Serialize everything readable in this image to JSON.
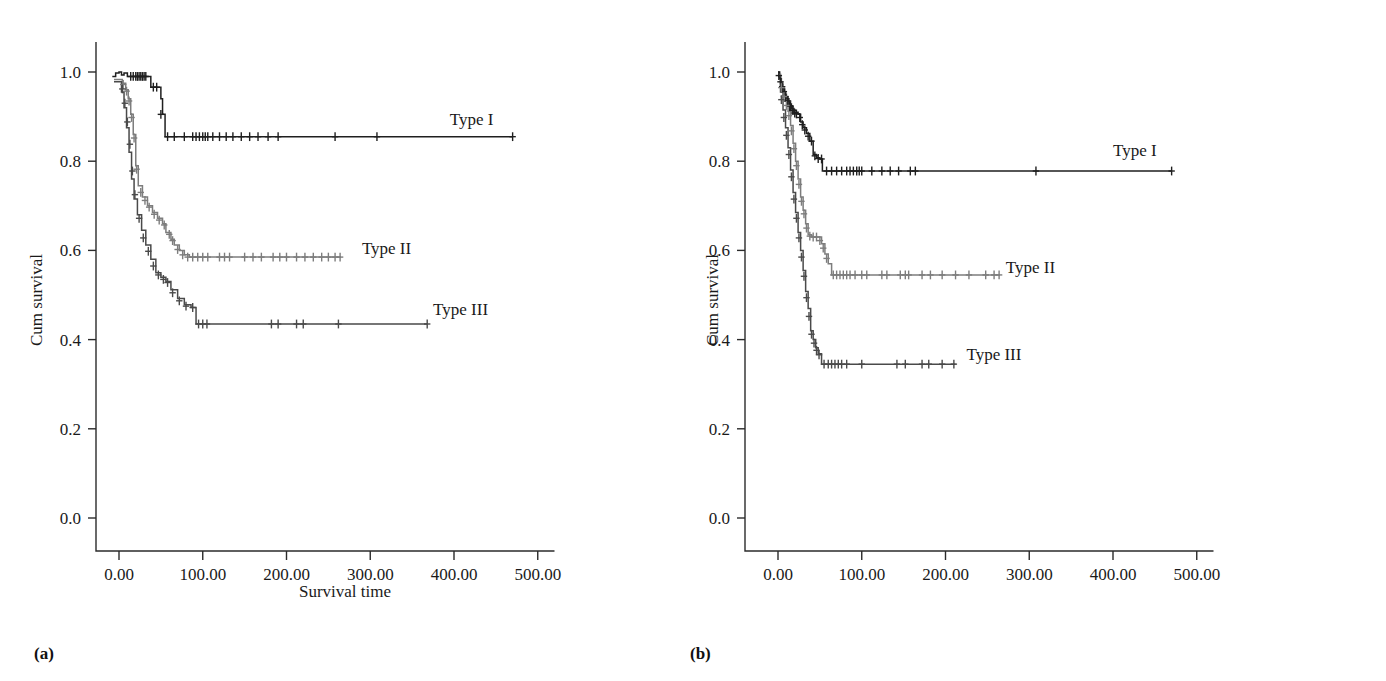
{
  "figure": {
    "panels": [
      {
        "id": "a",
        "caption": "(a)",
        "xlabel": "Survival time",
        "ylabel": "Cum survival"
      },
      {
        "id": "b",
        "caption": "(b)",
        "xlabel": "",
        "ylabel": "Cum survival"
      }
    ]
  },
  "labels": {
    "ylabel": "Cum survival",
    "xlabel_a": "Survival time",
    "caption_a": "(a)",
    "caption_b": "(b)",
    "type1": "Type I",
    "type2": "Type II",
    "type3": "Type III",
    "y_ticks": [
      "1.0",
      "0.8",
      "0.6",
      "0.4",
      "0.2",
      "0.0"
    ],
    "x_ticks": [
      "0.00",
      "100.00",
      "200.00",
      "300.00",
      "400.00",
      "500.00"
    ]
  },
  "colors": {
    "type1": "#1f1f1f",
    "type2": "#7d7d7d",
    "type3": "#4a4a4a",
    "axis": "#2b2b2b",
    "text": "#1a1a1a",
    "background": "#ffffff"
  },
  "chart_data": [
    {
      "type": "line",
      "subtype": "kaplan-meier",
      "panel": "a",
      "title": "",
      "xlabel": "Survival time",
      "ylabel": "Cum survival",
      "xlim": [
        -20,
        520
      ],
      "ylim": [
        0.0,
        1.02
      ],
      "x_ticks": [
        0,
        100,
        200,
        300,
        400,
        500
      ],
      "x_tick_labels": [
        "0.00",
        "100.00",
        "200.00",
        "300.00",
        "400.00",
        "500.00"
      ],
      "y_ticks": [
        0.0,
        0.2,
        0.4,
        0.6,
        0.8,
        1.0
      ],
      "y_tick_labels": [
        "0.0",
        "0.2",
        "0.4",
        "0.6",
        "0.8",
        "1.0"
      ],
      "grid": false,
      "legend_position": "inline-right-of-curve",
      "series": [
        {
          "name": "Type I",
          "color": "#1f1f1f",
          "label_x": 395,
          "label_y": 0.895,
          "steps": [
            [
              -8,
              0.99
            ],
            [
              -4,
              0.998
            ],
            [
              0,
              1.0
            ],
            [
              3,
              0.993
            ],
            [
              6,
              0.998
            ],
            [
              10,
              0.99
            ],
            [
              34,
              0.99
            ],
            [
              38,
              0.966
            ],
            [
              47,
              0.966
            ],
            [
              50,
              0.94
            ],
            [
              52,
              0.905
            ],
            [
              55,
              0.855
            ],
            [
              470,
              0.855
            ]
          ],
          "censors_x": [
            14,
            17,
            20,
            22,
            24,
            26,
            28,
            30,
            32,
            41,
            45,
            50,
            58,
            66,
            78,
            88,
            92,
            96,
            100,
            103,
            106,
            112,
            120,
            128,
            136,
            146,
            156,
            166,
            178,
            190,
            258,
            308,
            470
          ],
          "censor_y": [
            0.99,
            0.99,
            0.99,
            0.99,
            0.99,
            0.99,
            0.99,
            0.99,
            0.99,
            0.966,
            0.966,
            0.905,
            0.855,
            0.855,
            0.855,
            0.855,
            0.855,
            0.855,
            0.855,
            0.855,
            0.855,
            0.855,
            0.855,
            0.855,
            0.855,
            0.855,
            0.855,
            0.855,
            0.855,
            0.855,
            0.855,
            0.855,
            0.855
          ],
          "plateau_value": 0.855,
          "max_x": 470
        },
        {
          "name": "Type II",
          "color": "#7d7d7d",
          "label_x": 290,
          "label_y": 0.605,
          "steps": [
            [
              -6,
              0.983
            ],
            [
              0,
              0.983
            ],
            [
              4,
              0.975
            ],
            [
              8,
              0.96
            ],
            [
              11,
              0.94
            ],
            [
              14,
              0.905
            ],
            [
              17,
              0.86
            ],
            [
              20,
              0.79
            ],
            [
              23,
              0.745
            ],
            [
              28,
              0.72
            ],
            [
              34,
              0.7
            ],
            [
              40,
              0.685
            ],
            [
              46,
              0.672
            ],
            [
              52,
              0.66
            ],
            [
              56,
              0.64
            ],
            [
              62,
              0.625
            ],
            [
              66,
              0.612
            ],
            [
              72,
              0.6
            ],
            [
              78,
              0.59
            ],
            [
              84,
              0.585
            ],
            [
              265,
              0.585
            ]
          ],
          "censors_x": [
            5,
            9,
            12,
            15,
            18,
            21,
            26,
            31,
            36,
            42,
            48,
            54,
            60,
            64,
            70,
            76,
            82,
            88,
            94,
            100,
            106,
            120,
            126,
            132,
            150,
            160,
            170,
            184,
            192,
            200,
            212,
            222,
            232,
            242,
            250,
            258,
            264
          ],
          "censor_y": [
            0.972,
            0.957,
            0.935,
            0.898,
            0.852,
            0.782,
            0.73,
            0.712,
            0.697,
            0.681,
            0.668,
            0.657,
            0.636,
            0.622,
            0.602,
            0.59,
            0.585,
            0.585,
            0.585,
            0.585,
            0.585,
            0.585,
            0.585,
            0.585,
            0.585,
            0.585,
            0.585,
            0.585,
            0.585,
            0.585,
            0.585,
            0.585,
            0.585,
            0.585,
            0.585,
            0.585,
            0.585
          ],
          "plateau_value": 0.585,
          "max_x": 265
        },
        {
          "name": "Type III",
          "color": "#4a4a4a",
          "label_x": 375,
          "label_y": 0.468,
          "steps": [
            [
              -6,
              0.978
            ],
            [
              0,
              0.978
            ],
            [
              3,
              0.955
            ],
            [
              6,
              0.92
            ],
            [
              9,
              0.875
            ],
            [
              12,
              0.82
            ],
            [
              15,
              0.76
            ],
            [
              18,
              0.715
            ],
            [
              22,
              0.68
            ],
            [
              27,
              0.645
            ],
            [
              32,
              0.612
            ],
            [
              38,
              0.58
            ],
            [
              44,
              0.55
            ],
            [
              50,
              0.54
            ],
            [
              56,
              0.53
            ],
            [
              62,
              0.512
            ],
            [
              70,
              0.492
            ],
            [
              78,
              0.478
            ],
            [
              86,
              0.472
            ],
            [
              92,
              0.435
            ],
            [
              368,
              0.435
            ]
          ],
          "censors_x": [
            4,
            7,
            10,
            13,
            16,
            19,
            24,
            29,
            35,
            41,
            47,
            53,
            58,
            64,
            72,
            80,
            88,
            95,
            100,
            105,
            182,
            190,
            212,
            220,
            262,
            368
          ],
          "censor_y": [
            0.962,
            0.93,
            0.888,
            0.838,
            0.778,
            0.725,
            0.672,
            0.628,
            0.598,
            0.565,
            0.545,
            0.535,
            0.528,
            0.505,
            0.487,
            0.475,
            0.472,
            0.435,
            0.435,
            0.435,
            0.435,
            0.435,
            0.435,
            0.435,
            0.435,
            0.435
          ],
          "plateau_value": 0.435,
          "max_x": 368
        }
      ]
    },
    {
      "type": "line",
      "subtype": "kaplan-meier",
      "panel": "b",
      "title": "",
      "xlabel": "",
      "ylabel": "Cum survival",
      "xlim": [
        -20,
        520
      ],
      "ylim": [
        0.0,
        1.02
      ],
      "x_ticks": [
        0,
        100,
        200,
        300,
        400,
        500
      ],
      "x_tick_labels": [
        "0.00",
        "100.00",
        "200.00",
        "300.00",
        "400.00",
        "500.00"
      ],
      "y_ticks": [
        0.0,
        0.2,
        0.4,
        0.6,
        0.8,
        1.0
      ],
      "y_tick_labels": [
        "0.0",
        "0.2",
        "0.4",
        "0.6",
        "0.8",
        "1.0"
      ],
      "grid": false,
      "legend_position": "inline-right-of-curve",
      "series": [
        {
          "name": "Type I",
          "color": "#1f1f1f",
          "label_x": 400,
          "label_y": 0.825,
          "steps": [
            [
              0,
              1.0
            ],
            [
              2,
              0.985
            ],
            [
              4,
              0.972
            ],
            [
              6,
              0.962
            ],
            [
              8,
              0.95
            ],
            [
              10,
              0.94
            ],
            [
              13,
              0.928
            ],
            [
              16,
              0.918
            ],
            [
              19,
              0.91
            ],
            [
              24,
              0.905
            ],
            [
              27,
              0.888
            ],
            [
              30,
              0.875
            ],
            [
              34,
              0.862
            ],
            [
              38,
              0.845
            ],
            [
              42,
              0.815
            ],
            [
              46,
              0.808
            ],
            [
              50,
              0.805
            ],
            [
              53,
              0.778
            ],
            [
              470,
              0.778
            ]
          ],
          "censors_x": [
            1,
            3,
            5,
            7,
            9,
            11,
            12,
            14,
            15,
            17,
            18,
            20,
            22,
            26,
            29,
            32,
            36,
            40,
            44,
            48,
            52,
            58,
            64,
            70,
            76,
            82,
            86,
            90,
            94,
            97,
            100,
            112,
            124,
            134,
            144,
            158,
            164,
            308,
            470
          ],
          "censor_y": [
            0.992,
            0.978,
            0.967,
            0.956,
            0.945,
            0.935,
            0.935,
            0.924,
            0.924,
            0.914,
            0.914,
            0.908,
            0.906,
            0.898,
            0.882,
            0.87,
            0.856,
            0.845,
            0.812,
            0.806,
            0.805,
            0.778,
            0.778,
            0.778,
            0.778,
            0.778,
            0.778,
            0.778,
            0.778,
            0.778,
            0.778,
            0.778,
            0.778,
            0.778,
            0.778,
            0.778,
            0.778,
            0.778,
            0.778
          ],
          "plateau_value": 0.778,
          "max_x": 470
        },
        {
          "name": "Type II",
          "color": "#7d7d7d",
          "label_x": 272,
          "label_y": 0.562,
          "steps": [
            [
              0,
              0.995
            ],
            [
              3,
              0.975
            ],
            [
              6,
              0.955
            ],
            [
              9,
              0.935
            ],
            [
              12,
              0.912
            ],
            [
              15,
              0.88
            ],
            [
              18,
              0.84
            ],
            [
              21,
              0.8
            ],
            [
              24,
              0.76
            ],
            [
              27,
              0.72
            ],
            [
              30,
              0.69
            ],
            [
              33,
              0.66
            ],
            [
              36,
              0.635
            ],
            [
              40,
              0.63
            ],
            [
              48,
              0.63
            ],
            [
              52,
              0.615
            ],
            [
              56,
              0.592
            ],
            [
              60,
              0.57
            ],
            [
              64,
              0.545
            ],
            [
              265,
              0.545
            ]
          ],
          "censors_x": [
            4,
            7,
            10,
            13,
            16,
            19,
            22,
            25,
            28,
            31,
            34,
            38,
            42,
            46,
            50,
            54,
            58,
            66,
            70,
            74,
            78,
            82,
            86,
            92,
            100,
            106,
            124,
            130,
            146,
            152,
            156,
            172,
            182,
            196,
            212,
            228,
            248,
            258,
            264
          ],
          "censor_y": [
            0.965,
            0.945,
            0.925,
            0.902,
            0.868,
            0.828,
            0.79,
            0.748,
            0.71,
            0.682,
            0.65,
            0.632,
            0.63,
            0.63,
            0.622,
            0.605,
            0.582,
            0.545,
            0.545,
            0.545,
            0.545,
            0.545,
            0.545,
            0.545,
            0.545,
            0.545,
            0.545,
            0.545,
            0.545,
            0.545,
            0.545,
            0.545,
            0.545,
            0.545,
            0.545,
            0.545,
            0.545,
            0.545,
            0.545
          ],
          "plateau_value": 0.545,
          "max_x": 265
        },
        {
          "name": "Type III",
          "color": "#4a4a4a",
          "label_x": 225,
          "label_y": 0.368,
          "steps": [
            [
              0,
              0.99
            ],
            [
              3,
              0.955
            ],
            [
              6,
              0.915
            ],
            [
              9,
              0.875
            ],
            [
              12,
              0.83
            ],
            [
              15,
              0.78
            ],
            [
              18,
              0.73
            ],
            [
              21,
              0.685
            ],
            [
              24,
              0.64
            ],
            [
              27,
              0.6
            ],
            [
              30,
              0.555
            ],
            [
              33,
              0.508
            ],
            [
              36,
              0.47
            ],
            [
              39,
              0.42
            ],
            [
              42,
              0.4
            ],
            [
              45,
              0.382
            ],
            [
              48,
              0.368
            ],
            [
              52,
              0.345
            ],
            [
              212,
              0.345
            ]
          ],
          "censors_x": [
            4,
            7,
            10,
            13,
            16,
            19,
            22,
            25,
            28,
            31,
            34,
            37,
            40,
            43,
            46,
            49,
            55,
            60,
            64,
            68,
            72,
            76,
            82,
            100,
            142,
            152,
            172,
            180,
            196,
            210
          ],
          "censor_y": [
            0.938,
            0.898,
            0.858,
            0.815,
            0.765,
            0.715,
            0.672,
            0.628,
            0.585,
            0.542,
            0.494,
            0.452,
            0.412,
            0.392,
            0.376,
            0.366,
            0.345,
            0.345,
            0.345,
            0.345,
            0.345,
            0.345,
            0.345,
            0.345,
            0.345,
            0.345,
            0.345,
            0.345,
            0.345,
            0.345
          ],
          "plateau_value": 0.345,
          "max_x": 212
        }
      ]
    }
  ]
}
